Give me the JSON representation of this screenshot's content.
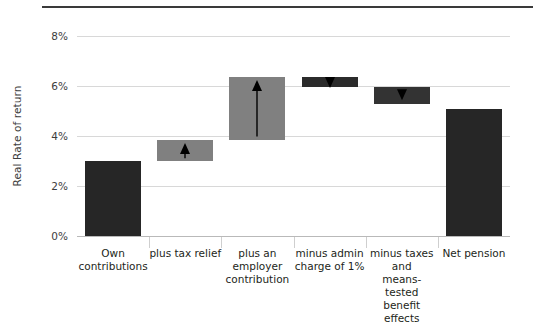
{
  "chart_data": {
    "type": "bar",
    "subtype": "waterfall",
    "title": "",
    "xlabel": "",
    "ylabel": "Real Rate of return",
    "ylim": [
      0,
      8
    ],
    "ytick_values": [
      0,
      2,
      4,
      6,
      8
    ],
    "ytick_labels": [
      "0%",
      "2%",
      "4%",
      "6%",
      "8%"
    ],
    "grid": true,
    "legend": "none",
    "categories": [
      "Own contributions",
      "plus tax relief",
      "plus an employer contribution",
      "minus admin charge of 1%",
      "minus taxes and means-tested benefit effects",
      "Net pension"
    ],
    "bars": [
      {
        "label_lines": [
          "Own",
          "contributions"
        ],
        "base": 0.0,
        "top": 3.0,
        "value": 3.0,
        "kind": "total",
        "color": "#262626",
        "arrow": "none"
      },
      {
        "label_lines": [
          "plus tax relief"
        ],
        "base": 3.0,
        "top": 3.85,
        "value": 0.85,
        "kind": "increase",
        "color": "#808080",
        "arrow": "up"
      },
      {
        "label_lines": [
          "plus an",
          "employer",
          "contribution"
        ],
        "base": 3.85,
        "top": 6.35,
        "value": 2.5,
        "kind": "increase",
        "color": "#808080",
        "arrow": "up"
      },
      {
        "label_lines": [
          "minus admin",
          "charge of 1%"
        ],
        "base": 5.95,
        "top": 6.35,
        "value": -0.4,
        "kind": "decrease",
        "color": "#2b2b2b",
        "arrow": "down"
      },
      {
        "label_lines": [
          "minus taxes",
          "and",
          "means-tested",
          "benefit effects"
        ],
        "base": 5.3,
        "top": 5.95,
        "value": -0.65,
        "kind": "decrease",
        "color": "#333333",
        "arrow": "down"
      },
      {
        "label_lines": [
          "Net pension"
        ],
        "base": 0.0,
        "top": 5.1,
        "value": 5.1,
        "kind": "total",
        "color": "#262626",
        "arrow": "none"
      }
    ]
  },
  "colors": {
    "increase": "#808080",
    "decrease": "#2f2f2f",
    "total": "#262626",
    "grid": "#d8d8d8",
    "text": "#231f20",
    "rule": "#3a3a3a"
  }
}
